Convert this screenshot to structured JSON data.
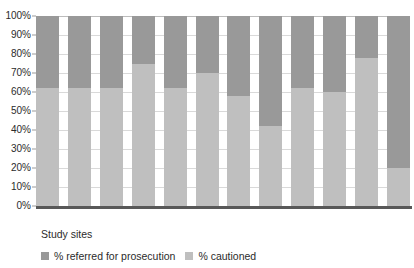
{
  "chart_data": {
    "type": "bar",
    "subtype": "100% stacked column",
    "title": "",
    "xlabel": "Study sites",
    "ylabel": "",
    "ylim": [
      0,
      100
    ],
    "ytick_labels": [
      "100%",
      "90%",
      "80%",
      "70%",
      "60%",
      "50%",
      "40%",
      "30%",
      "20%",
      "10%",
      "0%"
    ],
    "ytick_values": [
      100,
      90,
      80,
      70,
      60,
      50,
      40,
      30,
      20,
      10,
      0
    ],
    "grid": true,
    "legend_position": "bottom",
    "categories": [
      "1",
      "2",
      "3",
      "4",
      "5",
      "6",
      "7",
      "8",
      "9",
      "10",
      "11",
      "12"
    ],
    "series": [
      {
        "name": "% referred for prosecution",
        "color": "#999999",
        "values": [
          38,
          38,
          38,
          25,
          38,
          30,
          42,
          58,
          38,
          40,
          22,
          80
        ]
      },
      {
        "name": "% cautioned",
        "color": "#bfbfbf",
        "values": [
          62,
          62,
          62,
          75,
          62,
          70,
          58,
          42,
          62,
          60,
          78,
          20
        ]
      }
    ]
  },
  "legend": {
    "items": [
      {
        "label": "% referred for prosecution",
        "color": "#999999"
      },
      {
        "label": "% cautioned",
        "color": "#bfbfbf"
      }
    ]
  },
  "axis": {
    "x_label": "Study sites"
  }
}
